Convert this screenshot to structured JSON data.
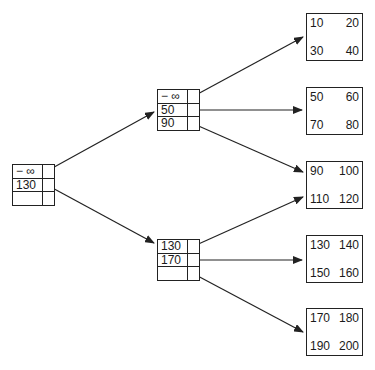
{
  "diagram": {
    "type": "B+ tree",
    "root": {
      "keys": [
        "− ∞",
        "130",
        ""
      ]
    },
    "internal_nodes": [
      {
        "keys": [
          "− ∞",
          "50",
          "90"
        ]
      },
      {
        "keys": [
          "130",
          "170",
          ""
        ]
      }
    ],
    "leaves": [
      {
        "values": [
          "10",
          "20",
          "30",
          "40"
        ]
      },
      {
        "values": [
          "50",
          "60",
          "70",
          "80"
        ]
      },
      {
        "values": [
          "90",
          "100",
          "110",
          "120"
        ]
      },
      {
        "values": [
          "130",
          "140",
          "150",
          "160"
        ]
      },
      {
        "values": [
          "170",
          "180",
          "190",
          "200"
        ]
      }
    ],
    "colors": {
      "line": "#222222",
      "background": "#ffffff"
    }
  }
}
